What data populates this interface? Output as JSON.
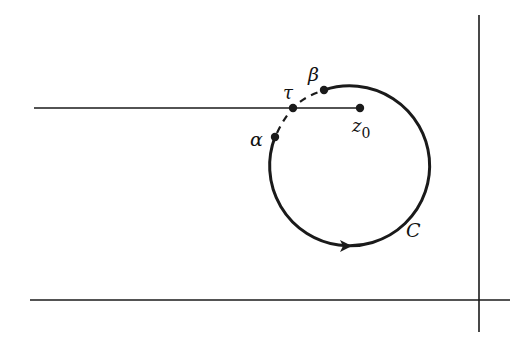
{
  "diagram": {
    "type": "contour-diagram",
    "colors": {
      "stroke": "#1a1a1a",
      "background": "#ffffff"
    },
    "axes": {
      "horizontal_axis": {
        "x1": 30,
        "y1": 300,
        "x2": 510,
        "y2": 300
      },
      "vertical_axis": {
        "x1": 479,
        "y1": 15,
        "x2": 479,
        "y2": 332
      }
    },
    "branch_cut": {
      "x1": 34,
      "y1": 108,
      "x2": 360,
      "y2": 108
    },
    "circle": {
      "cx": 348,
      "cy": 166,
      "r": 80,
      "label": "C"
    },
    "points": {
      "alpha": {
        "x": 275,
        "y": 137,
        "label": "α"
      },
      "beta": {
        "x": 324,
        "y": 90,
        "label": "β"
      },
      "tau": {
        "x": 293,
        "y": 108,
        "label": "τ"
      },
      "z0": {
        "x": 360,
        "y": 108,
        "label": "z",
        "subscript": "0"
      }
    },
    "labels": {
      "alpha": "α",
      "beta": "β",
      "tau": "τ",
      "z0_main": "z",
      "z0_sub": "0",
      "contour": "C"
    }
  }
}
